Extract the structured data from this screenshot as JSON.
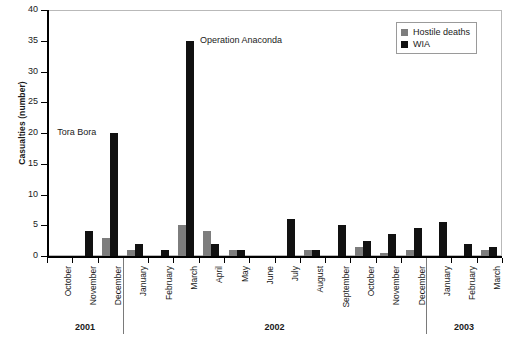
{
  "chart_data": {
    "type": "bar",
    "title": "",
    "xlabel": "",
    "ylabel": "Casualties (number)",
    "ylim": [
      0,
      40
    ],
    "yticks": [
      0,
      5,
      10,
      15,
      20,
      25,
      30,
      35,
      40
    ],
    "grid": false,
    "legend_position": "top-right",
    "categories": [
      "October",
      "November",
      "December",
      "January",
      "February",
      "March",
      "April",
      "May",
      "June",
      "July",
      "August",
      "September",
      "October",
      "November",
      "December",
      "January",
      "February",
      "March"
    ],
    "group_labels": [
      {
        "label": "2001",
        "start": 0,
        "end": 2
      },
      {
        "label": "2002",
        "start": 3,
        "end": 14
      },
      {
        "label": "2003",
        "start": 15,
        "end": 17
      }
    ],
    "series": [
      {
        "name": "Hostile deaths",
        "color": "#7d7d7d",
        "values": [
          0,
          0,
          3,
          1,
          0,
          5,
          4,
          1,
          0,
          0,
          1,
          0,
          1.5,
          0.5,
          1,
          0,
          0,
          1
        ]
      },
      {
        "name": "WIA",
        "color": "#111111",
        "values": [
          0,
          4,
          20,
          2,
          1,
          35,
          2,
          1,
          0,
          6,
          1,
          5,
          2.5,
          3.5,
          4.5,
          5.5,
          2,
          1.5
        ]
      }
    ],
    "annotations": [
      {
        "text": "Tora Bora",
        "category": "December",
        "year": "2001"
      },
      {
        "text": "Operation Anaconda",
        "category": "March",
        "year": "2002"
      }
    ]
  },
  "axis": {
    "y_title": "Casualties (number)",
    "y_tick_labels": [
      "0",
      "5",
      "10",
      "15",
      "20",
      "25",
      "30",
      "35",
      "40"
    ]
  },
  "legend": {
    "items": [
      {
        "label": "Hostile deaths",
        "color": "#7d7d7d"
      },
      {
        "label": "WIA",
        "color": "#111111"
      }
    ]
  }
}
